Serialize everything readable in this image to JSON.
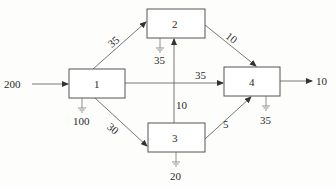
{
  "diagram": {
    "type": "network-flow",
    "nodes": [
      {
        "id": "1",
        "label": "1",
        "x": 69,
        "y": 69,
        "w": 56,
        "h": 29,
        "demand": "100",
        "demand_x": 97,
        "demand_y": 128
      },
      {
        "id": "2",
        "label": "2",
        "x": 147,
        "y": 9,
        "w": 58,
        "h": 29,
        "demand": "35",
        "demand_x": 160,
        "demand_y": 64
      },
      {
        "id": "3",
        "label": "3",
        "x": 148,
        "y": 123,
        "w": 57,
        "h": 29,
        "demand": "20",
        "demand_x": 176,
        "demand_y": 181
      },
      {
        "id": "4",
        "label": "4",
        "x": 224,
        "y": 67,
        "w": 56,
        "h": 29,
        "demand": "35",
        "demand_x": 266,
        "demand_y": 124
      }
    ],
    "source": {
      "label": "200",
      "target": "1"
    },
    "sink": {
      "label": "10",
      "source": "4"
    },
    "edges": [
      {
        "from": "1",
        "to": "2",
        "label": "35"
      },
      {
        "from": "1",
        "to": "4",
        "label": "35"
      },
      {
        "from": "1",
        "to": "3",
        "label": "30"
      },
      {
        "from": "2",
        "to": "4",
        "label": "10"
      },
      {
        "from": "3",
        "to": "2",
        "label": "10"
      },
      {
        "from": "3",
        "to": "4",
        "label": "5"
      }
    ]
  },
  "labels": {
    "source_in": "200",
    "sink_out": "10",
    "e12": "35",
    "e14": "35",
    "e13": "30",
    "e24": "10",
    "e32": "10",
    "e34": "5",
    "n1": "1",
    "n2": "2",
    "n3": "3",
    "n4": "4",
    "d1": "100",
    "d2": "35",
    "d3": "20",
    "d4": "35"
  }
}
